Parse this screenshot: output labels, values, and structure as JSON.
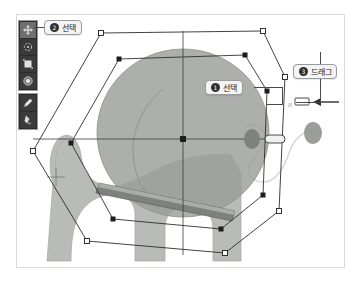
{
  "app": {
    "title": "Vector shape editor canvas",
    "canvas_background": "#ffffff",
    "canvas_border_color": "#d9d9d9"
  },
  "toolbar": {
    "name": "tool-palette",
    "background": "#2b2b2b",
    "groups": [
      {
        "name": "transform-group",
        "tools": [
          {
            "id": "move",
            "icon": "move-tool-icon",
            "label": "Move",
            "active": true
          },
          {
            "id": "rotate",
            "icon": "rotate-tool-icon",
            "label": "Rotate",
            "active": false
          },
          {
            "id": "scale",
            "icon": "scale-tool-icon",
            "label": "Scale",
            "active": false
          },
          {
            "id": "sphere",
            "icon": "sphere-tool-icon",
            "label": "Sphere",
            "active": false
          }
        ]
      },
      {
        "name": "draw-group",
        "tools": [
          {
            "id": "pen",
            "icon": "pen-tool-icon",
            "label": "Pen",
            "active": false
          },
          {
            "id": "paint",
            "icon": "paint-tool-icon",
            "label": "Paint",
            "active": false
          }
        ]
      }
    ]
  },
  "callouts": [
    {
      "id": "select-tool",
      "badge": "❶",
      "number": "2",
      "text": "선택",
      "meaning": "Select (tool)"
    },
    {
      "id": "select-object",
      "badge": "❶",
      "number": "1",
      "text": "선택",
      "meaning": "Select (object)"
    },
    {
      "id": "drag",
      "badge": "❶",
      "number": "3",
      "text": "드래그",
      "meaning": "Drag"
    }
  ],
  "artwork": {
    "name": "cat-illustration",
    "body_fill": "#b8bbb8",
    "body_stroke": "#a7aaa7",
    "head_fill": "#9a9d9a",
    "head_opacity": 0.85,
    "collar_fill": "#7e817e",
    "collar_highlight": "#a9aca9"
  },
  "selection": {
    "name": "shape-selection",
    "outer_polygon_stroke": "#2a2a2a",
    "inner_polygon_stroke": "#3a3a3a",
    "handle_fill": "#1d1d1d",
    "axis_stroke": "#3a3a3a",
    "vertex_count": 7,
    "handles": [
      {
        "id": "h-top",
        "x": 164,
        "y": 16
      },
      {
        "id": "h-upper-left",
        "x": 86,
        "y": 63
      },
      {
        "id": "h-left",
        "x": 80,
        "y": 144
      },
      {
        "id": "h-lower-left",
        "x": 120,
        "y": 207
      },
      {
        "id": "h-bottom",
        "x": 202,
        "y": 230
      },
      {
        "id": "h-lower-right",
        "x": 256,
        "y": 192
      },
      {
        "id": "h-right",
        "x": 258,
        "y": 80
      }
    ],
    "center": {
      "x": 164,
      "y": 124
    },
    "drag_handle": {
      "id": "drag-handle",
      "x": 245,
      "y": 124,
      "w": 16,
      "h": 6
    },
    "target_handle": {
      "id": "drop-target-handle",
      "x": 296,
      "y": 102,
      "w": 11,
      "h": 5
    },
    "cursor_marker": {
      "id": "anchor-crosshair",
      "x": 42,
      "y": 176
    }
  },
  "leash": {
    "name": "leash-path",
    "stroke": "#cfd2cf",
    "knob_fill": "#9a9d9a"
  }
}
